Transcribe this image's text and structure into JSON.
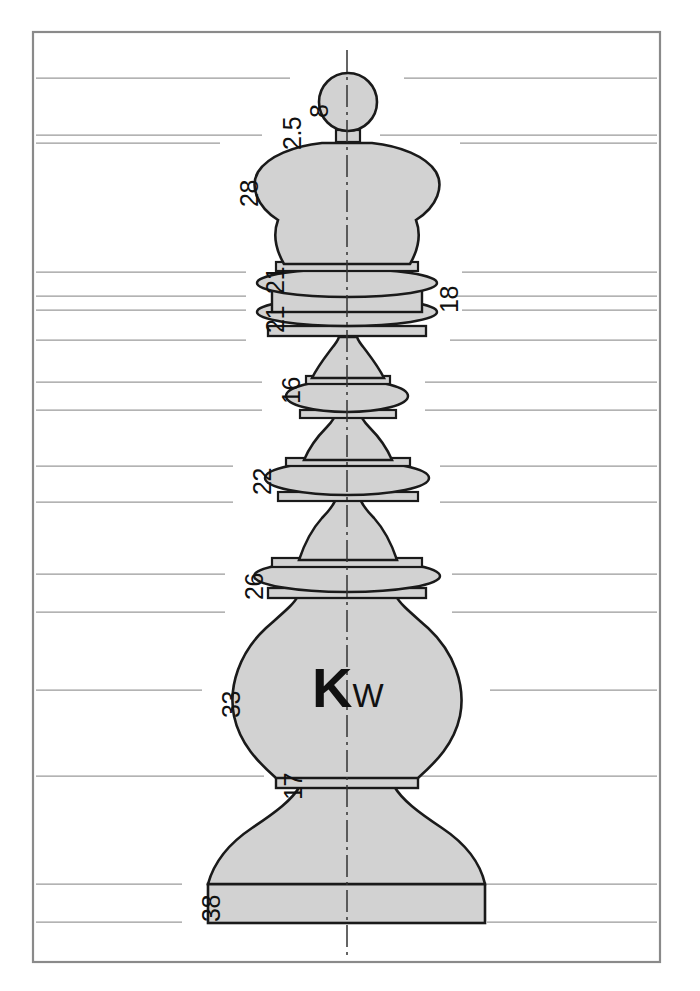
{
  "drawing": {
    "title": "Chess King Turning Profile",
    "part_label": {
      "main": "K",
      "sub": "W"
    },
    "colors": {
      "fill": "#d2d2d2",
      "outline": "#1a1a1a",
      "frame": "#8a8a8a",
      "extension_line": "#9a9a9a",
      "centerline": "#333333",
      "background": "#ffffff"
    },
    "frame": {
      "x": 33,
      "y": 32,
      "width": 627,
      "height": 930
    },
    "centerline": {
      "x": 347,
      "y_top": 50,
      "y_bottom": 958
    },
    "dimensions": [
      {
        "value": "8",
        "x": 307,
        "y": 118,
        "line_y": 78,
        "line_x1": 36,
        "line_x2": 290
      },
      {
        "value": "2.5",
        "x": 280,
        "y": 150,
        "line_y": 135,
        "line_x1": 36,
        "line_x2": 262
      },
      {
        "value": "28",
        "x": 237,
        "y": 207,
        "line_y": 143,
        "line_x1": 36,
        "line_x2": 220
      },
      {
        "value": "21",
        "x": 263,
        "y": 294,
        "line_y": 272,
        "line_x1": 36,
        "line_x2": 246
      },
      {
        "value": "21",
        "x": 263,
        "y": 333,
        "line_y": 310,
        "line_x1": 36,
        "line_x2": 246
      },
      {
        "value": "18",
        "x": 437,
        "y": 313,
        "line_y": 296,
        "line_x1": 455,
        "line_x2": 657
      },
      {
        "value": "16",
        "x": 279,
        "y": 404,
        "line_y": 382,
        "line_x1": 36,
        "line_x2": 262
      },
      {
        "value": "22",
        "x": 250,
        "y": 495,
        "line_y": 466,
        "line_x1": 36,
        "line_x2": 233
      },
      {
        "value": "26",
        "x": 242,
        "y": 600,
        "line_y": 574,
        "line_x1": 36,
        "line_x2": 225
      },
      {
        "value": "33",
        "x": 219,
        "y": 718,
        "line_y": 690,
        "line_x1": 36,
        "line_x2": 202
      },
      {
        "value": "17",
        "x": 281,
        "y": 800,
        "line_y": 776,
        "line_x1": 36,
        "line_x2": 264
      },
      {
        "value": "38",
        "x": 199,
        "y": 922,
        "line_y": 884,
        "line_x1": 36,
        "line_x2": 182
      }
    ],
    "extension_lines_right": [
      {
        "y": 78,
        "x1": 404,
        "x2": 657
      },
      {
        "y": 135,
        "x1": 380,
        "x2": 657
      },
      {
        "y": 143,
        "x1": 460,
        "x2": 657
      },
      {
        "y": 272,
        "x1": 462,
        "x2": 657
      },
      {
        "y": 296,
        "x1": 455,
        "x2": 657
      },
      {
        "y": 310,
        "x1": 462,
        "x2": 657
      },
      {
        "y": 340,
        "x1": 450,
        "x2": 657
      },
      {
        "y": 382,
        "x1": 425,
        "x2": 657
      },
      {
        "y": 410,
        "x1": 425,
        "x2": 657
      },
      {
        "y": 466,
        "x1": 440,
        "x2": 657
      },
      {
        "y": 502,
        "x1": 440,
        "x2": 657
      },
      {
        "y": 574,
        "x1": 452,
        "x2": 657
      },
      {
        "y": 612,
        "x1": 452,
        "x2": 657
      },
      {
        "y": 690,
        "x1": 490,
        "x2": 657
      },
      {
        "y": 776,
        "x1": 420,
        "x2": 657
      },
      {
        "y": 884,
        "x1": 487,
        "x2": 657
      },
      {
        "y": 922,
        "x1": 487,
        "x2": 657
      }
    ],
    "extension_lines_left": [
      {
        "y": 78,
        "x1": 36,
        "x2": 290
      },
      {
        "y": 135,
        "x1": 36,
        "x2": 262
      },
      {
        "y": 143,
        "x1": 36,
        "x2": 220
      },
      {
        "y": 272,
        "x1": 36,
        "x2": 246
      },
      {
        "y": 296,
        "x1": 36,
        "x2": 246
      },
      {
        "y": 310,
        "x1": 36,
        "x2": 246
      },
      {
        "y": 340,
        "x1": 36,
        "x2": 246
      },
      {
        "y": 382,
        "x1": 36,
        "x2": 262
      },
      {
        "y": 410,
        "x1": 36,
        "x2": 262
      },
      {
        "y": 466,
        "x1": 36,
        "x2": 233
      },
      {
        "y": 502,
        "x1": 36,
        "x2": 233
      },
      {
        "y": 574,
        "x1": 36,
        "x2": 225
      },
      {
        "y": 612,
        "x1": 36,
        "x2": 225
      },
      {
        "y": 690,
        "x1": 36,
        "x2": 202
      },
      {
        "y": 776,
        "x1": 36,
        "x2": 264
      },
      {
        "y": 884,
        "x1": 36,
        "x2": 182
      },
      {
        "y": 922,
        "x1": 36,
        "x2": 182
      }
    ],
    "profile_notes": [
      "finial sphere",
      "sphere neck",
      "crown bulb",
      "upper collar ring",
      "collar band",
      "lower collar ring",
      "upper waist",
      "mid ring",
      "mid waist",
      "mid collar",
      "lower waist",
      "shoulder collar",
      "main bulb",
      "bulb fillet",
      "foot flare",
      "base plinth"
    ]
  }
}
